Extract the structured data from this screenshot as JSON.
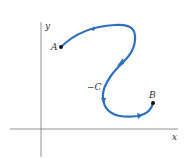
{
  "diagram": {
    "type": "line-integral-path",
    "axes": {
      "x_label": "x",
      "y_label": "y"
    },
    "curve": {
      "label": "−C",
      "color": "#2f6fc0",
      "direction": "from B to A"
    },
    "points": [
      {
        "label": "A"
      },
      {
        "label": "B"
      }
    ]
  }
}
